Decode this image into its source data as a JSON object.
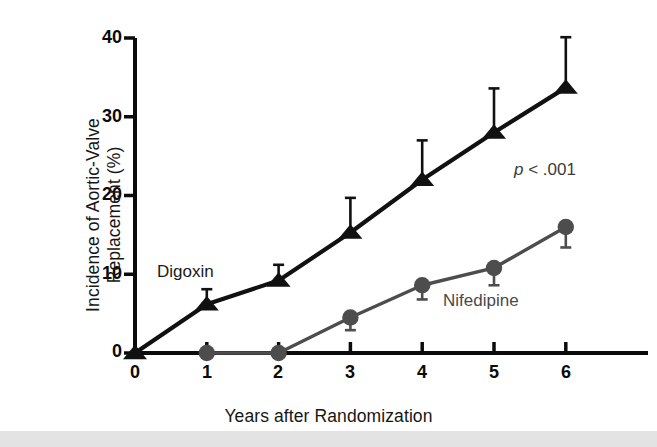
{
  "chart_data": {
    "type": "line",
    "title": "",
    "xlabel": "Years after Randomization",
    "ylabel": "Incidence of Aortic-Valve Replacement (%)",
    "xlim": [
      0,
      6.6
    ],
    "ylim": [
      0,
      40
    ],
    "xticks": [
      0,
      1,
      2,
      3,
      4,
      5,
      6
    ],
    "xtick_labels": [
      "0",
      "1",
      "2",
      "3",
      "4",
      "5",
      "6"
    ],
    "yticks": [
      0,
      10,
      20,
      30,
      40
    ],
    "ytick_labels": [
      "0",
      "10",
      "20",
      "30",
      "40"
    ],
    "grid": false,
    "legend_position": "inline-annotations",
    "annotations": [
      {
        "name": "p-value",
        "text": "p < .001",
        "italic_prefix": "p",
        "rest": " < .001",
        "x": 4.9,
        "y": 18.5
      },
      {
        "name": "digoxin-label",
        "text": "Digoxin",
        "x": 0.42,
        "y": 10.5
      },
      {
        "name": "nifedipine-label",
        "text": "Nifedipine",
        "x": 4.25,
        "y": 7.0
      }
    ],
    "series": [
      {
        "name": "Digoxin",
        "marker": "triangle",
        "color": "#111111",
        "x": [
          0,
          1,
          2,
          3,
          4,
          5,
          6
        ],
        "values": [
          0,
          6.2,
          9.2,
          15.3,
          22.0,
          28.0,
          33.7
        ],
        "error_upper": [
          0,
          1.9,
          2.0,
          4.4,
          5.0,
          5.6,
          6.4
        ],
        "error_direction": "up"
      },
      {
        "name": "Nifedipine",
        "marker": "circle",
        "color": "#4d4d4d",
        "x": [
          1,
          2,
          3,
          4,
          5,
          6
        ],
        "values": [
          0,
          0,
          4.5,
          8.6,
          10.8,
          16.0
        ],
        "error_lower": [
          0,
          0,
          1.6,
          1.8,
          2.2,
          2.6
        ],
        "error_direction": "down"
      }
    ]
  },
  "axes": {
    "x_title": "Years after Randomization",
    "y_title": "Incidence of Aortic-Valve Replacement (%)"
  },
  "labels": {
    "digoxin": "Digoxin",
    "nifedipine": "Nifedipine",
    "p_value_prefix": "p",
    "p_value_rest": " < .001"
  },
  "ticks": {
    "x": [
      "0",
      "1",
      "2",
      "3",
      "4",
      "5",
      "6"
    ],
    "y": [
      "0",
      "10",
      "20",
      "30",
      "40"
    ]
  },
  "colors": {
    "digoxin": "#111111",
    "nifedipine": "#4d4d4d",
    "axis": "#0b0b0b",
    "background": "#ffffff",
    "bottom_strip": "#e3e3e3"
  }
}
